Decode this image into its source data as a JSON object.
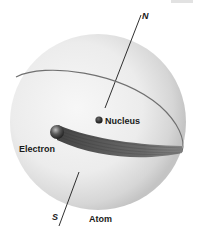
{
  "figure": {
    "title": "Atom",
    "labels": {
      "north": "N",
      "south": "S",
      "nucleus": "Nucleus",
      "electron": "Electron",
      "atom": "Atom"
    },
    "colors": {
      "sphere_light": "#f4f4f4",
      "sphere_shade": "#c9c9c9",
      "orbit": "#6e6e6e",
      "axis": "#1a1a1a",
      "nucleus": "#151515",
      "electron": "#2a2a2a",
      "trail": "#4a4a4a"
    }
  }
}
